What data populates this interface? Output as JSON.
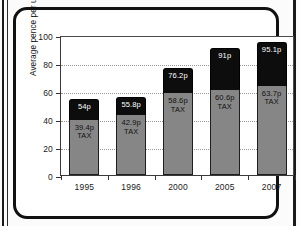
{
  "chart_data": {
    "type": "bar",
    "subtype": "stacked-bar",
    "title": "",
    "xlabel": "",
    "ylabel": "Average pence per unleaded litre",
    "ylim": [
      0,
      100
    ],
    "yticks": [
      0,
      20,
      40,
      60,
      80,
      100
    ],
    "ytick_labels": [
      "0",
      "20",
      "40",
      "60",
      "80",
      "100"
    ],
    "grid": "horizontal-dotted",
    "legend": "none",
    "categories": [
      "1995",
      "1996",
      "2000",
      "2005",
      "2007"
    ],
    "series": [
      {
        "name": "TAX",
        "values": [
          39.4,
          42.9,
          58.6,
          60.6,
          63.7
        ],
        "color": "#868686",
        "labels": [
          "39.4p",
          "42.9p",
          "58.6p",
          "60.6p",
          "63.7p"
        ],
        "sublabel": "TAX"
      },
      {
        "name": "Total price",
        "values": [
          54.0,
          55.8,
          76.2,
          91.0,
          95.1
        ],
        "color": "#0d0d0d",
        "labels": [
          "54p",
          "55.8p",
          "76.2p",
          "91p",
          "95.1p"
        ],
        "note": "black segment is the remainder above tax; label shows bar total"
      }
    ],
    "bars": [
      {
        "category": "1995",
        "total": 54.0,
        "total_label": "54p",
        "tax": 39.4,
        "tax_label": "39.4p",
        "tax_word": "TAX"
      },
      {
        "category": "1996",
        "total": 55.8,
        "total_label": "55.8p",
        "tax": 42.9,
        "tax_label": "42.9p",
        "tax_word": "TAX"
      },
      {
        "category": "2000",
        "total": 76.2,
        "total_label": "76.2p",
        "tax": 58.6,
        "tax_label": "58.6p",
        "tax_word": "TAX"
      },
      {
        "category": "2005",
        "total": 91.0,
        "total_label": "91p",
        "tax": 60.6,
        "tax_label": "60.6p",
        "tax_word": "TAX"
      },
      {
        "category": "2007",
        "total": 95.1,
        "total_label": "95.1p",
        "tax": 63.7,
        "tax_label": "63.7p",
        "tax_word": "TAX"
      }
    ],
    "colors": {
      "tax_segment": "#868686",
      "price_segment": "#0d0d0d",
      "frame": "#111111",
      "gridline": "#9a9a9a",
      "background": "#ffffff"
    }
  }
}
